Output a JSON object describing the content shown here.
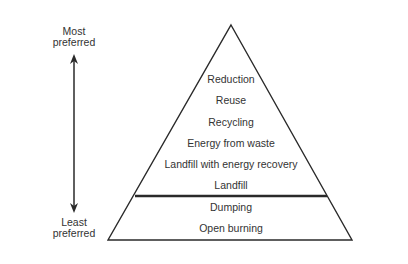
{
  "scale": {
    "top_label_line1": "Most",
    "top_label_line2": "preferred",
    "bottom_label_line1": "Least",
    "bottom_label_line2": "preferred"
  },
  "pyramid": {
    "upper_levels": [
      {
        "label": "Reduction"
      },
      {
        "label": "Reuse"
      },
      {
        "label": "Recycling"
      },
      {
        "label": "Energy from waste"
      },
      {
        "label": "Landfill with energy recovery"
      },
      {
        "label": "Landfill"
      }
    ],
    "lower_levels": [
      {
        "label": "Dumping"
      },
      {
        "label": "Open burning"
      }
    ]
  },
  "colors": {
    "line": "#2a2a2a",
    "text": "#333333",
    "background": "#ffffff"
  }
}
